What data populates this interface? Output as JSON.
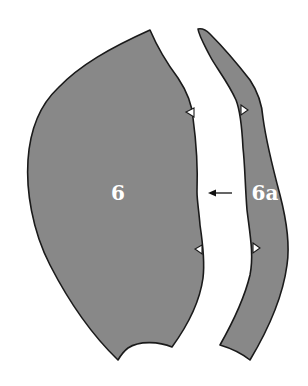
{
  "diagram": {
    "type": "sewing-pattern-pieces",
    "colors": {
      "background": "#ffffff",
      "piece_fill": "#888888",
      "outline": "#1a1a1a",
      "label": "#ffffff",
      "arrow": "#111111"
    },
    "pieces": [
      {
        "id": "6",
        "label": "6",
        "notches": 2
      },
      {
        "id": "6a",
        "label": "6a",
        "notches": 2
      }
    ],
    "annotations": [
      {
        "type": "arrow",
        "direction": "left",
        "from": "6a",
        "to": "6"
      }
    ]
  }
}
